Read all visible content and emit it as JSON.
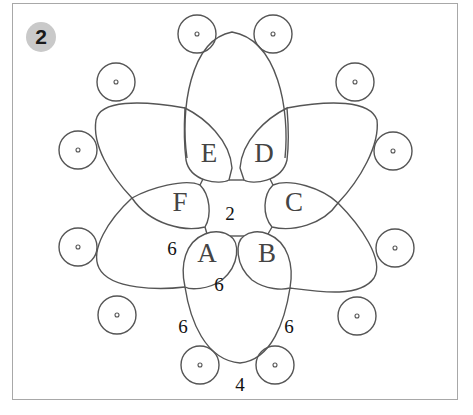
{
  "figure": {
    "badge": "2",
    "colors": {
      "stroke": "#555555",
      "badge_bg": "#c9c9c9",
      "frame": "#a8a8a8"
    }
  },
  "rings": [
    {
      "label": "A",
      "x": 207,
      "y": 262
    },
    {
      "label": "B",
      "x": 267,
      "y": 262
    },
    {
      "label": "C",
      "x": 294,
      "y": 211
    },
    {
      "label": "D",
      "x": 264,
      "y": 162
    },
    {
      "label": "E",
      "x": 209,
      "y": 162
    },
    {
      "label": "F",
      "x": 180,
      "y": 211
    }
  ],
  "counts": [
    {
      "id": "center",
      "value": "2",
      "x": 230,
      "y": 220
    },
    {
      "id": "ring-a-left",
      "value": "6",
      "x": 172,
      "y": 255
    },
    {
      "id": "ring-a-bottom",
      "value": "6",
      "x": 219,
      "y": 291
    },
    {
      "id": "chain-left",
      "value": "6",
      "x": 183,
      "y": 333
    },
    {
      "id": "chain-right",
      "value": "6",
      "x": 289,
      "y": 333
    },
    {
      "id": "chain-bottom",
      "value": "4",
      "x": 240,
      "y": 391
    }
  ],
  "picots": [
    {
      "x": 197,
      "y": 34
    },
    {
      "x": 273,
      "y": 34
    },
    {
      "x": 116,
      "y": 82
    },
    {
      "x": 355,
      "y": 82
    },
    {
      "x": 78,
      "y": 150
    },
    {
      "x": 393,
      "y": 151
    },
    {
      "x": 78,
      "y": 247
    },
    {
      "x": 395,
      "y": 248
    },
    {
      "x": 117,
      "y": 315
    },
    {
      "x": 357,
      "y": 316
    },
    {
      "x": 200,
      "y": 365
    },
    {
      "x": 275,
      "y": 365
    }
  ]
}
